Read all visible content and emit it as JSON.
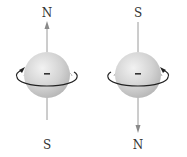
{
  "diagram": {
    "colors": {
      "sphere": "#d4d4d4",
      "axis": "#9a9a9a",
      "rotation": "#222222",
      "label": "#333333"
    },
    "particles": [
      {
        "charge_symbol": "−",
        "top_label": "N",
        "bottom_label": "S",
        "magnetic_arrow": "up",
        "rotation": "counterclockwise-from-above"
      },
      {
        "charge_symbol": "−",
        "top_label": "S",
        "bottom_label": "N",
        "magnetic_arrow": "down",
        "rotation": "clockwise-from-above"
      }
    ]
  }
}
